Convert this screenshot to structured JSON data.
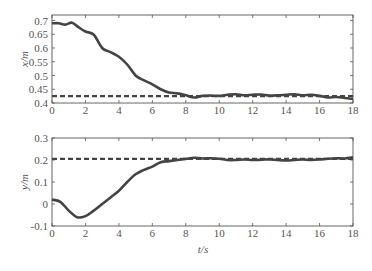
{
  "chart_data": [
    {
      "type": "line",
      "title": "",
      "xlabel": "",
      "ylabel": "x/m",
      "xlim": [
        0,
        18
      ],
      "ylim": [
        0.4,
        0.72
      ],
      "xticks": [
        0,
        2,
        4,
        6,
        8,
        10,
        12,
        14,
        16,
        18
      ],
      "yticks": [
        0.4,
        0.45,
        0.5,
        0.55,
        0.6,
        0.65,
        0.7
      ],
      "ytick_labels": [
        "0.4",
        "0.45",
        "0.5",
        "0.55",
        "0.6",
        "0.65",
        "0.7"
      ],
      "grid": false,
      "legend": null,
      "series": [
        {
          "name": "actual",
          "style": "solid",
          "color": "#444444",
          "x": [
            0,
            0.4,
            0.8,
            1.2,
            1.6,
            2,
            2.5,
            3,
            3.5,
            4,
            4.5,
            5,
            5.5,
            6,
            6.5,
            7,
            7.5,
            8,
            8.5,
            9,
            9.5,
            10,
            10.5,
            11,
            11.5,
            12,
            12.5,
            13,
            13.5,
            14,
            14.5,
            15,
            15.5,
            16,
            16.5,
            17,
            17.5,
            18
          ],
          "y": [
            0.69,
            0.69,
            0.685,
            0.692,
            0.675,
            0.66,
            0.648,
            0.6,
            0.585,
            0.568,
            0.54,
            0.5,
            0.482,
            0.468,
            0.45,
            0.438,
            0.435,
            0.428,
            0.42,
            0.426,
            0.427,
            0.426,
            0.43,
            0.432,
            0.428,
            0.43,
            0.431,
            0.427,
            0.428,
            0.43,
            0.432,
            0.428,
            0.43,
            0.426,
            0.42,
            0.422,
            0.418,
            0.415
          ]
        },
        {
          "name": "reference",
          "style": "dashed",
          "color": "#444444",
          "x": [
            0,
            18
          ],
          "y": [
            0.425,
            0.425
          ]
        }
      ]
    },
    {
      "type": "line",
      "title": "",
      "xlabel": "t/s",
      "ylabel": "y/m",
      "xlim": [
        0,
        18
      ],
      "ylim": [
        -0.1,
        0.3
      ],
      "xticks": [
        0,
        2,
        4,
        6,
        8,
        10,
        12,
        14,
        16,
        18
      ],
      "yticks": [
        -0.1,
        0,
        0.1,
        0.2,
        0.3
      ],
      "ytick_labels": [
        "-0.1",
        "0",
        "0.1",
        "0.2",
        "0.3"
      ],
      "grid": false,
      "legend": null,
      "series": [
        {
          "name": "actual",
          "style": "solid",
          "color": "#444444",
          "x": [
            0,
            0.5,
            1,
            1.5,
            2,
            2.5,
            3,
            3.5,
            4,
            4.5,
            5,
            5.5,
            6,
            6.5,
            7,
            7.5,
            8,
            8.5,
            9,
            9.5,
            10,
            10.5,
            11,
            11.5,
            12,
            12.5,
            13,
            13.5,
            14,
            14.5,
            15,
            15.5,
            16,
            16.5,
            17,
            17.5,
            18
          ],
          "y": [
            0.02,
            0.01,
            -0.03,
            -0.06,
            -0.055,
            -0.03,
            0.0,
            0.03,
            0.06,
            0.1,
            0.135,
            0.155,
            0.17,
            0.19,
            0.195,
            0.2,
            0.205,
            0.21,
            0.207,
            0.208,
            0.206,
            0.2,
            0.2,
            0.202,
            0.2,
            0.201,
            0.203,
            0.2,
            0.198,
            0.2,
            0.202,
            0.2,
            0.202,
            0.206,
            0.208,
            0.207,
            0.212
          ]
        },
        {
          "name": "reference",
          "style": "dashed",
          "color": "#444444",
          "x": [
            0,
            18
          ],
          "y": [
            0.205,
            0.205
          ]
        }
      ]
    }
  ],
  "axes": {
    "top": {
      "ylabel": "x/m"
    },
    "bottom": {
      "ylabel": "y/m",
      "xlabel": "t/s"
    }
  }
}
